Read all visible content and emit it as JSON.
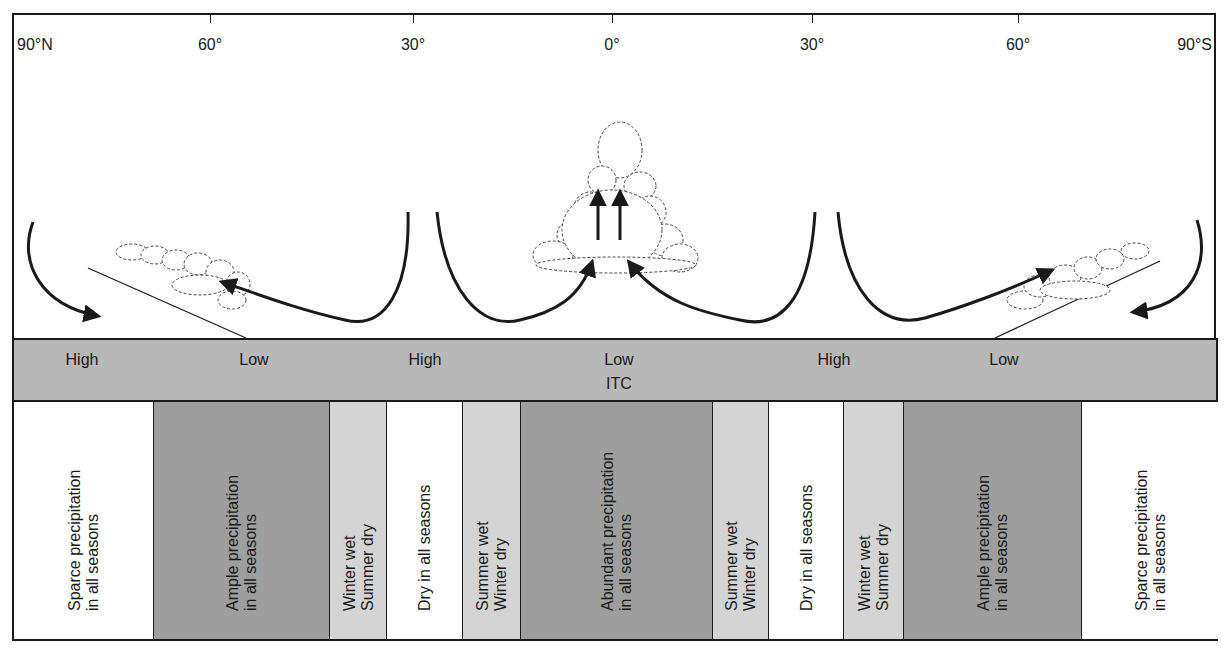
{
  "latitude_axis": {
    "labels": [
      {
        "text": "90°N",
        "x": 17,
        "align": "left"
      },
      {
        "text": "60°",
        "x": 210,
        "align": "center",
        "tick": true
      },
      {
        "text": "30°",
        "x": 413,
        "align": "center",
        "tick": true
      },
      {
        "text": "0°",
        "x": 612,
        "align": "center",
        "tick": true
      },
      {
        "text": "30°",
        "x": 812,
        "align": "center",
        "tick": true
      },
      {
        "text": "60°",
        "x": 1018,
        "align": "center",
        "tick": true
      },
      {
        "text": "90°S",
        "x": 1212,
        "align": "right"
      }
    ]
  },
  "pressure_belts": {
    "labels": [
      {
        "text": "High",
        "x": 80
      },
      {
        "text": "Low",
        "x": 252
      },
      {
        "text": "High",
        "x": 423
      },
      {
        "text": "Low",
        "x": 617
      },
      {
        "text": "High",
        "x": 832
      },
      {
        "text": "Low",
        "x": 1002
      }
    ],
    "itc": {
      "text": "ITC",
      "x": 617
    },
    "color": "#b8b8b8"
  },
  "zones": [
    {
      "left": 12,
      "right": 152,
      "shade": "white",
      "lines": [
        "Sparce precipitation",
        "in all seasons"
      ]
    },
    {
      "left": 152,
      "right": 328,
      "shade": "dark",
      "lines": [
        "Ample precipitation",
        "in all seasons"
      ]
    },
    {
      "left": 328,
      "right": 385,
      "shade": "light",
      "lines": [
        "Winter wet",
        "Summer dry"
      ]
    },
    {
      "left": 385,
      "right": 461,
      "shade": "white",
      "lines": [
        "Dry in all seasons"
      ]
    },
    {
      "left": 461,
      "right": 519,
      "shade": "light",
      "lines": [
        "Summer wet",
        "Winter dry"
      ]
    },
    {
      "left": 519,
      "right": 711,
      "shade": "dark",
      "lines": [
        "Abundant precipitation",
        "in all seasons"
      ]
    },
    {
      "left": 711,
      "right": 767,
      "shade": "light",
      "lines": [
        "Summer wet",
        "Winter dry"
      ]
    },
    {
      "left": 767,
      "right": 842,
      "shade": "white",
      "lines": [
        "Dry in all seasons"
      ]
    },
    {
      "left": 842,
      "right": 902,
      "shade": "light",
      "lines": [
        "Winter wet",
        "Summer dry"
      ]
    },
    {
      "left": 902,
      "right": 1080,
      "shade": "dark",
      "lines": [
        "Ample precipitation",
        "in all seasons"
      ]
    },
    {
      "left": 1080,
      "right": 1218,
      "shade": "white",
      "lines": [
        "Sparce precipitation",
        "in all seasons"
      ]
    }
  ],
  "colors": {
    "white": "#ffffff",
    "light": "#d4d4d4",
    "dark": "#9e9e9e",
    "line": "#1a1a1a"
  },
  "icons": {
    "circulation_arrows": "curved-arrow-icon",
    "clouds": "cloud-icon",
    "fronts": "front-line-icon"
  }
}
